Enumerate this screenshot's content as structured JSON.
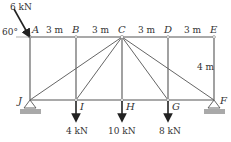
{
  "diagram": {
    "type": "truss",
    "nodes": {
      "A": {
        "label": "A",
        "x": 30,
        "y": 37
      },
      "B": {
        "label": "B",
        "x": 76,
        "y": 37
      },
      "C": {
        "label": "C",
        "x": 122,
        "y": 37
      },
      "D": {
        "label": "D",
        "x": 168,
        "y": 37
      },
      "E": {
        "label": "E",
        "x": 214,
        "y": 37
      },
      "J": {
        "label": "J",
        "x": 30,
        "y": 100
      },
      "I": {
        "label": "I",
        "x": 76,
        "y": 100
      },
      "H": {
        "label": "H",
        "x": 122,
        "y": 100
      },
      "G": {
        "label": "G",
        "x": 168,
        "y": 100
      },
      "F": {
        "label": "F",
        "x": 214,
        "y": 100
      }
    },
    "members": [
      [
        "A",
        "B"
      ],
      [
        "B",
        "C"
      ],
      [
        "C",
        "D"
      ],
      [
        "D",
        "E"
      ],
      [
        "J",
        "I"
      ],
      [
        "I",
        "H"
      ],
      [
        "H",
        "G"
      ],
      [
        "G",
        "F"
      ],
      [
        "A",
        "J"
      ],
      [
        "B",
        "I"
      ],
      [
        "C",
        "H"
      ],
      [
        "D",
        "G"
      ],
      [
        "E",
        "F"
      ],
      [
        "C",
        "J"
      ],
      [
        "C",
        "I"
      ],
      [
        "C",
        "G"
      ],
      [
        "C",
        "F"
      ]
    ],
    "dimensions": {
      "span_AB": "3 m",
      "span_BC": "3 m",
      "span_CD": "3 m",
      "span_DE": "3 m",
      "height": "4 m"
    },
    "loads": {
      "A": {
        "label": "6 kN",
        "angle_label": "60°"
      },
      "I": {
        "label": "4 kN"
      },
      "H": {
        "label": "10 kN"
      },
      "G": {
        "label": "8 kN"
      }
    },
    "supports": {
      "J": "pin",
      "F": "pin"
    }
  }
}
